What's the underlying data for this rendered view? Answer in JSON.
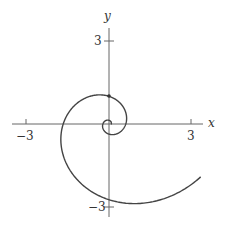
{
  "chart_data": {
    "type": "line",
    "title": "",
    "xlabel": "x",
    "ylabel": "y",
    "xlim": [
      -3.4,
      3.9
    ],
    "ylim": [
      -3.2,
      3.9
    ],
    "grid": false,
    "legend": null,
    "x_ticks": [
      {
        "value": -3,
        "label": "−3"
      },
      {
        "value": 3,
        "label": "3"
      }
    ],
    "y_ticks": [
      {
        "value": 3,
        "label": "3"
      },
      {
        "value": -3,
        "label": "−3"
      }
    ],
    "series": [
      {
        "name": "spiral",
        "curve": "r = exp(0.32*(theta - pi/2))",
        "theta_range": [
          -6.5,
          5.76
        ],
        "approx_points": [
          [
            0.0,
            0.1
          ],
          [
            0.6,
            0.0
          ],
          [
            0.0,
            1.0
          ],
          [
            -1.77,
            0.0
          ],
          [
            0.0,
            -2.85
          ],
          [
            3.4,
            -1.9
          ]
        ],
        "color": "#444444"
      }
    ],
    "annotations": [
      {
        "type": "point",
        "x": 0,
        "y": 1.0
      }
    ]
  },
  "axes": {
    "x_label": "x",
    "y_label": "y",
    "x_neg": "−3",
    "x_pos": "3",
    "y_pos": "3",
    "y_neg": "−3"
  }
}
